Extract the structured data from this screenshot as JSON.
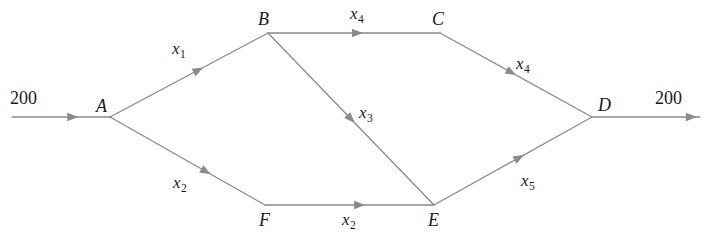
{
  "diagram": {
    "type": "network-flow-graph",
    "title": "",
    "line_color": "#8a8a8a",
    "text_color": "#1a1a1a",
    "background": "#ffffff",
    "nodes": [
      {
        "id": "A",
        "label": "A",
        "x": 110,
        "y": 117,
        "label_x": 96,
        "label_y": 97
      },
      {
        "id": "B",
        "label": "B",
        "x": 268,
        "y": 33,
        "label_x": 258,
        "label_y": 10
      },
      {
        "id": "C",
        "label": "C",
        "x": 440,
        "y": 33,
        "label_x": 432,
        "label_y": 10
      },
      {
        "id": "D",
        "label": "D",
        "x": 592,
        "y": 117,
        "label_x": 598,
        "label_y": 96
      },
      {
        "id": "E",
        "label": "E",
        "x": 434,
        "y": 205,
        "label_x": 428,
        "label_y": 211
      },
      {
        "id": "F",
        "label": "F",
        "x": 265,
        "y": 205,
        "label_x": 259,
        "label_y": 211
      }
    ],
    "edges": [
      {
        "id": "in-A",
        "from": "source",
        "to": "A",
        "x1": 12,
        "y1": 117,
        "x2": 110,
        "y2": 117,
        "label": "",
        "sub": "",
        "label_x": 0,
        "label_y": 0,
        "arrow_t": 0.62
      },
      {
        "id": "A-B",
        "from": "A",
        "to": "B",
        "x1": 110,
        "y1": 117,
        "x2": 268,
        "y2": 33,
        "label": "x",
        "sub": "1",
        "label_x": 172,
        "label_y": 40,
        "arrow_t": 0.56
      },
      {
        "id": "B-C",
        "from": "B",
        "to": "C",
        "x1": 268,
        "y1": 33,
        "x2": 440,
        "y2": 33,
        "label": "x",
        "sub": "4",
        "label_x": 350,
        "label_y": 5,
        "arrow_t": 0.52
      },
      {
        "id": "C-D",
        "from": "C",
        "to": "D",
        "x1": 440,
        "y1": 33,
        "x2": 592,
        "y2": 117,
        "label": "x",
        "sub": "4",
        "label_x": 516,
        "label_y": 55,
        "arrow_t": 0.47
      },
      {
        "id": "B-E",
        "from": "B",
        "to": "E",
        "x1": 268,
        "y1": 33,
        "x2": 434,
        "y2": 205,
        "label": "x",
        "sub": "3",
        "label_x": 359,
        "label_y": 104,
        "arrow_t": 0.5
      },
      {
        "id": "A-F",
        "from": "A",
        "to": "F",
        "x1": 110,
        "y1": 117,
        "x2": 265,
        "y2": 205,
        "label": "x",
        "sub": "2",
        "label_x": 173,
        "label_y": 174,
        "arrow_t": 0.62
      },
      {
        "id": "F-E",
        "from": "F",
        "to": "E",
        "x1": 265,
        "y1": 205,
        "x2": 434,
        "y2": 205,
        "label": "x",
        "sub": "2",
        "label_x": 342,
        "label_y": 211,
        "arrow_t": 0.56
      },
      {
        "id": "E-D",
        "from": "E",
        "to": "D",
        "x1": 434,
        "y1": 205,
        "x2": 592,
        "y2": 117,
        "label": "x",
        "sub": "5",
        "label_x": 521,
        "label_y": 172,
        "arrow_t": 0.54
      },
      {
        "id": "D-out",
        "from": "D",
        "to": "sink",
        "x1": 592,
        "y1": 117,
        "x2": 700,
        "y2": 117,
        "label": "",
        "sub": "",
        "label_x": 0,
        "label_y": 0,
        "arrow_t": 0.92
      }
    ],
    "flow_labels": [
      {
        "id": "inflow",
        "text": "200",
        "x": 10,
        "y": 89
      },
      {
        "id": "outflow",
        "text": "200",
        "x": 655,
        "y": 89
      }
    ]
  }
}
